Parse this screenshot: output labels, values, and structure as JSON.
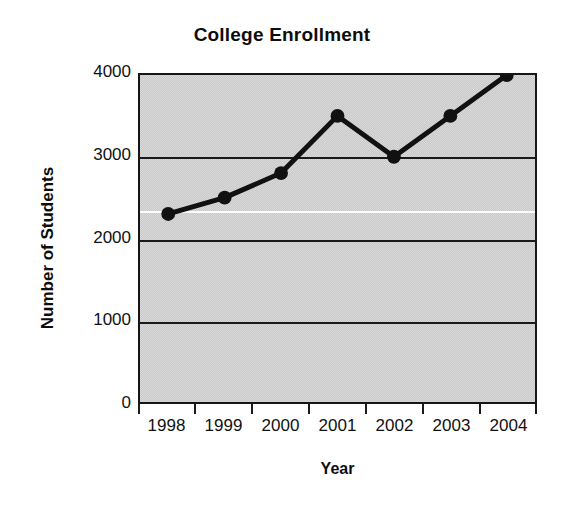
{
  "chart_data": {
    "type": "line",
    "title": "College Enrollment",
    "xlabel": "Year",
    "ylabel": "Number of Students",
    "categories": [
      "1998",
      "1999",
      "2000",
      "2001",
      "2002",
      "2003",
      "2004"
    ],
    "values": [
      2300,
      2500,
      2800,
      3500,
      3000,
      3500,
      4000
    ],
    "series": [
      {
        "name": "Enrollment",
        "values": [
          2300,
          2500,
          2800,
          3500,
          3000,
          3500,
          4000
        ]
      }
    ],
    "ylim": [
      0,
      4000
    ],
    "ytick_labels": [
      "0",
      "1000",
      "2000",
      "3000",
      "4000"
    ],
    "ytick_values": [
      0,
      1000,
      2000,
      3000,
      4000
    ],
    "xtick_labels": [
      "1998",
      "1999",
      "2000",
      "2001",
      "2002",
      "2003",
      "2004"
    ],
    "grid": true,
    "gridlines_at": [
      1000,
      2000,
      3000
    ],
    "legend": null,
    "legend_position": "none",
    "marker": "circle",
    "colors": {
      "line": "#111111",
      "marker": "#111111",
      "plot_background": "#c9c9c9",
      "frame": "#161616",
      "gridline": "#1a1a1a",
      "page_background": "#ffffff",
      "text": "#0d0d0d"
    }
  }
}
